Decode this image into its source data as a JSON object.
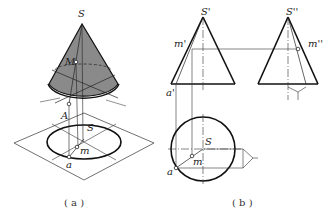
{
  "figure": {
    "panels": [
      {
        "id": "a",
        "caption": "( a )",
        "description": "Isometric view of right circular cone with point M on surface, projected onto horizontal plane",
        "labels": {
          "apex": "S",
          "surface_point": "M",
          "base_point": "A",
          "projected_apex": "S",
          "projected_point": "m",
          "projected_base_point": "a"
        }
      },
      {
        "id": "b",
        "caption": "( b )",
        "description": "Three-view orthographic projection of cone: front view, side view, top view",
        "labels": {
          "front_apex": "S'",
          "front_point": "m'",
          "front_base_point": "a'",
          "side_apex": "S''",
          "side_point": "m''",
          "top_center": "S",
          "top_point": "m",
          "top_base_point": "a"
        }
      }
    ],
    "colors": {
      "cone_fill": "#8a8a8a",
      "stroke": "#1a1a1a",
      "thin": "#333333",
      "background": "#ffffff"
    }
  }
}
